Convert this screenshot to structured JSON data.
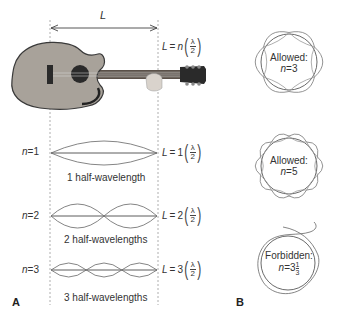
{
  "panel_a": {
    "label": "A",
    "length_symbol": "L",
    "general_equation": {
      "lhs": "L",
      "eq": "=",
      "coef": "n",
      "num": "λ",
      "den": "2"
    },
    "modes": [
      {
        "n_label": "n",
        "n_eq": "=",
        "n_value": "1",
        "caption": "1 half-wavelength",
        "equation": {
          "lhs": "L",
          "eq": "=",
          "coef": "1",
          "num": "λ",
          "den": "2"
        }
      },
      {
        "n_label": "n",
        "n_eq": "=",
        "n_value": "2",
        "caption": "2 half-wavelengths",
        "equation": {
          "lhs": "L",
          "eq": "=",
          "coef": "2",
          "num": "λ",
          "den": "2"
        }
      },
      {
        "n_label": "n",
        "n_eq": "=",
        "n_value": "3",
        "caption": "3 half-wavelengths",
        "equation": {
          "lhs": "L",
          "eq": "=",
          "coef": "3",
          "num": "λ",
          "den": "2"
        }
      }
    ]
  },
  "panel_b": {
    "label": "B",
    "orbits": [
      {
        "status": "Allowed:",
        "n_label": "n",
        "n_eq": "=",
        "n_value": "3",
        "fraction": null
      },
      {
        "status": "Allowed:",
        "n_label": "n",
        "n_eq": "=",
        "n_value": "5",
        "fraction": null
      },
      {
        "status": "Forbidden:",
        "n_label": "n",
        "n_eq": "=",
        "n_value": "3",
        "fraction": {
          "num": "1",
          "den": "3"
        }
      }
    ]
  },
  "colors": {
    "line": "#444444",
    "wave": "#666666",
    "guitar_body": "#a8a29a",
    "guitar_dark": "#2a2a2a",
    "dashed": "#999999"
  }
}
